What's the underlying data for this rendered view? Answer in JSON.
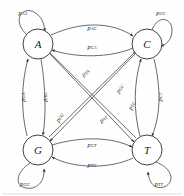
{
  "figure": {
    "type": "state-transition-diagram",
    "node_count": 4,
    "edge_count": 16
  },
  "nodes": [
    {
      "id": "A",
      "label": "A",
      "cx": 38,
      "cy": 44,
      "r": 15
    },
    {
      "id": "C",
      "label": "C",
      "cx": 147,
      "cy": 44,
      "r": 15
    },
    {
      "id": "G",
      "label": "G",
      "cx": 38,
      "cy": 150,
      "r": 15
    },
    {
      "id": "T",
      "label": "T",
      "cx": 147,
      "cy": 150,
      "r": 15
    }
  ],
  "self_loops": [
    {
      "id": "AA",
      "from": "A",
      "to": "A",
      "label": "p",
      "sub": "AA",
      "lx": 23,
      "ly": 12
    },
    {
      "id": "CC",
      "from": "C",
      "to": "C",
      "label": "p",
      "sub": "CC",
      "lx": 161,
      "ly": 12
    },
    {
      "id": "GG",
      "from": "G",
      "to": "G",
      "label": "p",
      "sub": "GG",
      "lx": 25,
      "ly": 183
    },
    {
      "id": "TT",
      "from": "T",
      "to": "T",
      "label": "p",
      "sub": "TT",
      "lx": 159,
      "ly": 183
    }
  ],
  "edges": [
    {
      "id": "AC",
      "from": "A",
      "to": "C",
      "label": "p",
      "sub": "AC",
      "lx": 92,
      "ly": 27,
      "rot": 0,
      "group": "top"
    },
    {
      "id": "CA",
      "from": "C",
      "to": "A",
      "label": "p",
      "sub": "CA",
      "lx": 92,
      "ly": 46,
      "rot": 0,
      "group": "top"
    },
    {
      "id": "GT",
      "from": "G",
      "to": "T",
      "label": "p",
      "sub": "GT",
      "lx": 92,
      "ly": 144,
      "rot": 0,
      "group": "bottom"
    },
    {
      "id": "TG",
      "from": "T",
      "to": "G",
      "label": "p",
      "sub": "TG",
      "lx": 92,
      "ly": 164,
      "rot": 0,
      "group": "bottom"
    },
    {
      "id": "GA",
      "from": "G",
      "to": "A",
      "label": "p",
      "sub": "GA",
      "lx": 22,
      "ly": 97,
      "rot": -90,
      "group": "left"
    },
    {
      "id": "AG",
      "from": "A",
      "to": "G",
      "label": "p",
      "sub": "AG",
      "lx": 44,
      "ly": 97,
      "rot": -90,
      "group": "left"
    },
    {
      "id": "CT",
      "from": "C",
      "to": "T",
      "label": "p",
      "sub": "CT",
      "lx": 159,
      "ly": 97,
      "rot": -90,
      "group": "right"
    },
    {
      "id": "TC",
      "from": "T",
      "to": "C",
      "label": "p",
      "sub": "TC",
      "lx": 131,
      "ly": 105,
      "rot": -62,
      "group": "diagonal"
    },
    {
      "id": "TA",
      "from": "T",
      "to": "A",
      "label": "p",
      "sub": "TA",
      "lx": 85,
      "ly": 72,
      "rot": -38,
      "group": "diagonal"
    },
    {
      "id": "GC",
      "from": "G",
      "to": "C",
      "label": "p",
      "sub": "GC",
      "lx": 119,
      "ly": 88,
      "rot": -58,
      "group": "diagonal"
    },
    {
      "id": "CG",
      "from": "C",
      "to": "G",
      "label": "p",
      "sub": "CG",
      "lx": 59,
      "ly": 117,
      "rot": -56,
      "group": "diagonal"
    },
    {
      "id": "AT",
      "from": "A",
      "to": "T",
      "label": "p",
      "sub": "AT",
      "lx": 103,
      "ly": 118,
      "rot": -35,
      "group": "diagonal"
    }
  ],
  "colors": {
    "stroke": "#3a3a3a",
    "node_stroke": "#2b2b2b",
    "text": "#262626",
    "background": "#ffffff"
  }
}
